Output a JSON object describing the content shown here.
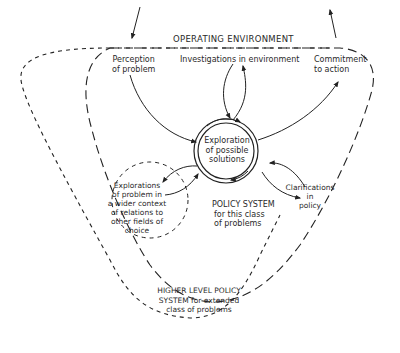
{
  "diagram": {
    "regions": {
      "operating_environment": "OPERATING ENVIRONMENT",
      "policy_system": [
        "POLICY SYSTEM",
        "for this class",
        "of problems"
      ],
      "higher_level": [
        "HIGHER LEVEL POLICY",
        "SYSTEM for extended",
        "class of problems"
      ]
    },
    "nodes": {
      "perception": [
        "Perception",
        "of problem"
      ],
      "investigations": "Investigations in environment",
      "commitment": [
        "Commitment",
        "to action"
      ],
      "exploration": [
        "Exploration",
        "of possible",
        "solutions"
      ],
      "wider_context": [
        "Explorations",
        "of problem in",
        "a wider context",
        "of relations to",
        "other fields of",
        "choice"
      ],
      "clarifications": [
        "Clarifications",
        "in",
        "policy"
      ]
    },
    "colors": {
      "ink": "#222222",
      "background": "#ffffff"
    }
  }
}
